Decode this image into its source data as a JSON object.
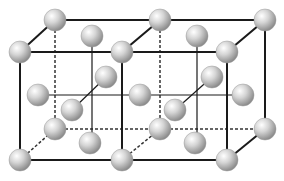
{
  "diagram": {
    "title": "",
    "colors": {
      "background": "#ffffff",
      "edge": "#1a1a1a",
      "hidden_edge": "#333333",
      "sphere_light": "#ffffff",
      "sphere_mid": "#c8c8c8",
      "sphere_dark": "#8a8a8a"
    },
    "sphere_radius": 11,
    "corners": {
      "front": [
        [
          20,
          52
        ],
        [
          122,
          52
        ],
        [
          227,
          52
        ],
        [
          20,
          160
        ],
        [
          122,
          160
        ],
        [
          227,
          160
        ]
      ],
      "back": [
        [
          55,
          20
        ],
        [
          160,
          20
        ],
        [
          265,
          20
        ],
        [
          55,
          129
        ],
        [
          160,
          129
        ],
        [
          265,
          129
        ]
      ]
    },
    "face_centers": {
      "top": [
        [
          92,
          36
        ],
        [
          197,
          36
        ]
      ],
      "bottom": [
        [
          90,
          143
        ],
        [
          195,
          143
        ]
      ],
      "side": [
        [
          38,
          95
        ],
        [
          140,
          95
        ],
        [
          243,
          95
        ]
      ],
      "front": [
        [
          72,
          110
        ],
        [
          175,
          110
        ]
      ],
      "back": [
        [
          106,
          77
        ],
        [
          212,
          77
        ]
      ]
    }
  }
}
